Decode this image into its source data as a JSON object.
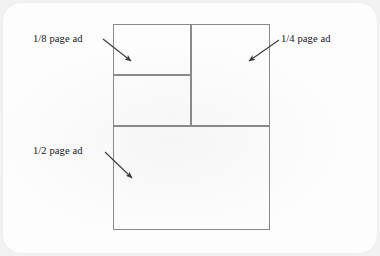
{
  "diagram": {
    "type": "page-layout-diagram",
    "page": {
      "label": "full page",
      "x": 113,
      "y": 24,
      "width": 157,
      "height": 206
    },
    "regions": [
      {
        "id": "eighth-top",
        "label": "1/8 page ad",
        "fraction": "1/8",
        "x": 0,
        "y": 0,
        "width": 78,
        "height": 51,
        "labelled": true
      },
      {
        "id": "eighth-bottom",
        "label": "",
        "fraction": "1/8",
        "x": 0,
        "y": 51,
        "width": 78,
        "height": 51,
        "labelled": false
      },
      {
        "id": "quarter",
        "label": "1/4 page ad",
        "fraction": "1/4",
        "x": 78,
        "y": 0,
        "width": 79,
        "height": 102,
        "labelled": true
      },
      {
        "id": "half",
        "label": "1/2 page ad",
        "fraction": "1/2",
        "x": 0,
        "y": 102,
        "width": 157,
        "height": 104,
        "labelled": true
      }
    ],
    "line_color": "#8a8a8a",
    "text_color": "#15161a",
    "background_color": "#fdfdfd",
    "outer_background_color": "#f2f2f2"
  },
  "annotations": [
    {
      "id": "callout-eighth",
      "text": "1/8 page ad",
      "text_x": 33,
      "text_y": 33,
      "arrow_from_x": 103,
      "arrow_from_y": 39,
      "arrow_to_x": 133,
      "arrow_to_y": 63,
      "direction": "down-right"
    },
    {
      "id": "callout-quarter",
      "text": "1/4 page ad",
      "text_x": 281,
      "text_y": 33,
      "arrow_from_x": 279,
      "arrow_from_y": 40,
      "arrow_to_x": 247,
      "arrow_to_y": 63,
      "direction": "down-left"
    },
    {
      "id": "callout-half",
      "text": "1/2 page ad",
      "text_x": 33,
      "text_y": 145,
      "arrow_from_x": 105,
      "arrow_from_y": 152,
      "arrow_to_x": 134,
      "arrow_to_y": 180,
      "direction": "down-right"
    }
  ]
}
